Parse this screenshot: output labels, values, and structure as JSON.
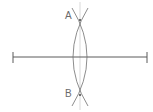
{
  "diagram": {
    "type": "perpendicular-bisector-construction",
    "segment": {
      "x1": 13,
      "x2": 147,
      "y": 57
    },
    "points": [
      {
        "label": "A",
        "x": 80,
        "y": 20
      },
      {
        "label": "B",
        "x": 80,
        "y": 95
      }
    ],
    "colors": {
      "line": "#5a5a5a",
      "arc": "#707070",
      "bisector": "#c8c8c8",
      "label": "#6a6a6a"
    }
  }
}
